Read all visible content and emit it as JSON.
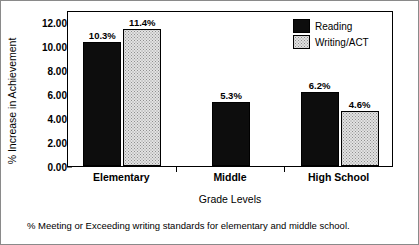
{
  "chart_data": {
    "type": "bar",
    "title": "",
    "xlabel": "Grade Levels",
    "ylabel": "% Increase in Achievement",
    "categories": [
      "Elementary",
      "Middle",
      "High School"
    ],
    "ylim": [
      0,
      13
    ],
    "yticks": [
      "0.00",
      "2.00",
      "4.00",
      "6.00",
      "8.00",
      "10.00",
      "12.00"
    ],
    "ytick_values": [
      0,
      2,
      4,
      6,
      8,
      10,
      12
    ],
    "grid": false,
    "legend_position": "top-right",
    "series": [
      {
        "name": "Reading",
        "color": "#0d0d0d",
        "values": [
          10.3,
          5.3,
          6.2
        ],
        "labels": [
          "10.3%",
          "5.3%",
          "6.2%"
        ]
      },
      {
        "name": "Writing/ACT",
        "color": "#e2e2e2",
        "values": [
          11.4,
          null,
          4.6
        ],
        "labels": [
          "11.4%",
          "",
          "4.6%"
        ]
      }
    ],
    "caption": "% Meeting or Exceeding writing standards for elementary and middle school."
  }
}
